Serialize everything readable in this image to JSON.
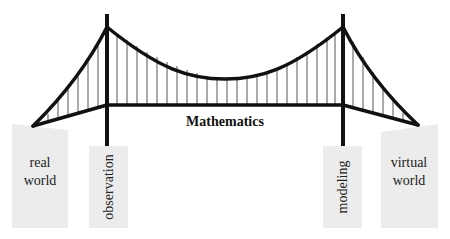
{
  "diagram": {
    "title": "Mathematics",
    "colors": {
      "structure": "#111111",
      "hanger": "#555555",
      "block_fill": "#ececec",
      "background": "#ffffff"
    },
    "left_bank": {
      "label_line1": "real",
      "label_line2": "world"
    },
    "right_bank": {
      "label_line1": "virtual",
      "label_line2": "world"
    },
    "left_pillar": {
      "label": "observation"
    },
    "right_pillar": {
      "label": "modeling"
    },
    "deck": {
      "label": "Mathematics"
    }
  }
}
